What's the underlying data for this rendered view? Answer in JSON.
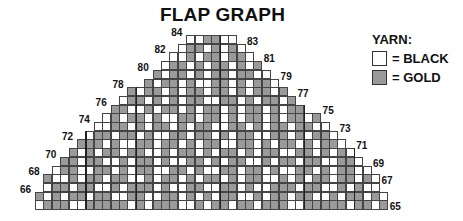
{
  "title": "FLAP GRAPH",
  "legend": {
    "title": "YARN:",
    "items": [
      {
        "label": "= BLACK",
        "color": "#ffffff"
      },
      {
        "label": "= GOLD",
        "color": "#9a9a9a"
      }
    ]
  },
  "grid": {
    "x0": 35,
    "y_bottom": 209,
    "cell_w": 8.4,
    "cell_h": 8.7,
    "colors": {
      "W": "#ffffff",
      "G": "#9a9a9a"
    },
    "rows": [
      {
        "n": 65,
        "c0": 0,
        "c1": 41,
        "side": "right",
        "pattern": "WGGGWWGGGGGWGWGGGWWGWGGWGGWGGGWWGGGGGWGGWG"
      },
      {
        "n": 66,
        "c0": 0,
        "c1": 41,
        "side": "left",
        "pattern": "GWGWGGWGGWWGGWWGGWGWGWGGWWGWGGWGGWWGWGGWGW"
      },
      {
        "n": 67,
        "c0": 1,
        "c1": 40,
        "side": "right",
        "pattern": "WGGWGGWWGWGGGWGWWGGWWGGWGWWGGGWGGWWGWGWW"
      },
      {
        "n": 68,
        "c0": 1,
        "c1": 40,
        "side": "left",
        "pattern": "GWWGWGGWGGWWGWGGWGWGGWGWGGWWGWGWGGWGGWGW"
      },
      {
        "n": 69,
        "c0": 2,
        "c1": 39,
        "side": "right",
        "pattern": "WGGWWGGWGWGGWWGGWGWWGGWGGWGWWGGWGWGGWW"
      },
      {
        "n": 70,
        "c0": 3,
        "c1": 38,
        "side": "left",
        "pattern": "GGWGGWWGWGGWGWWGGWGWGGWWGWGGWGGWWGGW"
      },
      {
        "n": 71,
        "c0": 4,
        "c1": 37,
        "side": "right",
        "pattern": "GWGWGGWGGWWGWGGWGWGGWGWGGWWGGWGWGW"
      },
      {
        "n": 72,
        "c0": 5,
        "c1": 36,
        "side": "left",
        "pattern": "GGGWGWWGGWGGWGWGGWWGGWGWGGWGWGGW"
      },
      {
        "n": 73,
        "c0": 6,
        "c1": 35,
        "side": "right",
        "pattern": "WGGWGGWGWWGGWGGWGWGGWWGGWGWGGW"
      },
      {
        "n": 74,
        "c0": 7,
        "c1": 34,
        "side": "left",
        "pattern": "WWGGWGWGGWGWGGWWGGWGWGGWGGWW"
      },
      {
        "n": 75,
        "c0": 8,
        "c1": 33,
        "side": "right",
        "pattern": "WGWGGWGWWGGWGGWGWGGWGWGGWG"
      },
      {
        "n": 76,
        "c0": 9,
        "c1": 31,
        "side": "left",
        "pattern": "GGWWGWGGWGWGGWGWGGWGWGG"
      },
      {
        "n": 77,
        "c0": 10,
        "c1": 30,
        "side": "right",
        "pattern": "WGGWGWGWGGWWGGWGWGGWG"
      },
      {
        "n": 78,
        "c0": 11,
        "c1": 29,
        "side": "left",
        "pattern": "GWGGWGWGGWGGWGWGGWG"
      },
      {
        "n": 79,
        "c0": 13,
        "c1": 28,
        "side": "right",
        "pattern": "GWGGWGWWGGWGWGGW"
      },
      {
        "n": 80,
        "c0": 14,
        "c1": 27,
        "side": "left",
        "pattern": "GWGGWGWGGWGGWW"
      },
      {
        "n": 81,
        "c0": 15,
        "c1": 26,
        "side": "right",
        "pattern": "WGGWGWGGWGWG"
      },
      {
        "n": 82,
        "c0": 16,
        "c1": 25,
        "side": "left",
        "pattern": "WWGWGGWGGW"
      },
      {
        "n": 83,
        "c0": 17,
        "c1": 24,
        "side": "right",
        "pattern": "WGGWGWGW"
      },
      {
        "n": 84,
        "c0": 18,
        "c1": 23,
        "side": "left",
        "pattern": "WWGGWW"
      }
    ]
  }
}
